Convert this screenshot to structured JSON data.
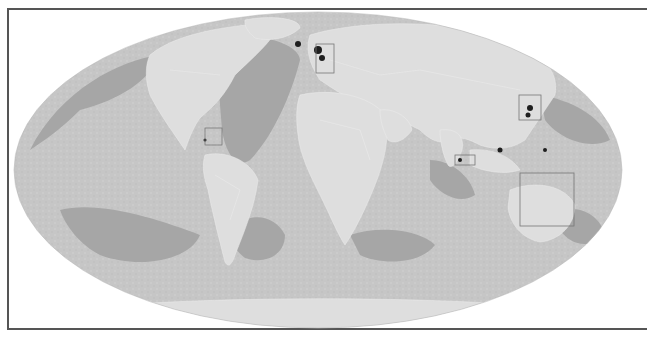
{
  "map": {
    "projection": "mollweide",
    "style": "grayscale",
    "colors": {
      "background": "#ffffff",
      "frame": "#555555",
      "ocean_deep": "#a9a9a9",
      "ocean_light": "#c8c8c8",
      "land": "#dcdcdc",
      "hotspot": "#1a1a1a",
      "box_stroke": "#777777"
    },
    "highlight_boxes": [
      {
        "name": "caribbean",
        "x": 205,
        "y": 128,
        "w": 17,
        "h": 17
      },
      {
        "name": "north-sea-europe",
        "x": 316,
        "y": 44,
        "w": 18,
        "h": 29
      },
      {
        "name": "japan-east-asia",
        "x": 519,
        "y": 95,
        "w": 22,
        "h": 25
      },
      {
        "name": "southeast-asia",
        "x": 455,
        "y": 155,
        "w": 20,
        "h": 10
      },
      {
        "name": "australia-indonesia",
        "x": 520,
        "y": 173,
        "w": 54,
        "h": 53
      }
    ]
  }
}
